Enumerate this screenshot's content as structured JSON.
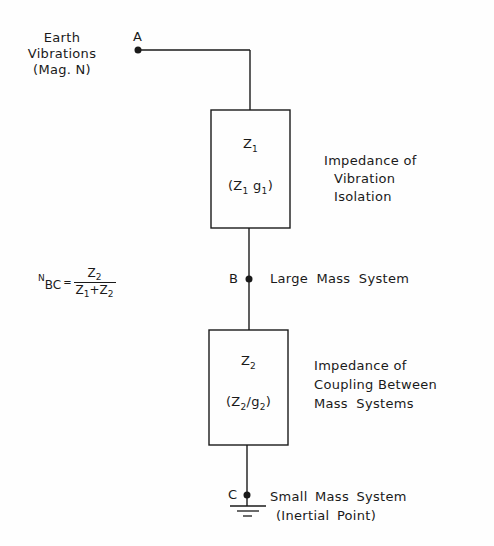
{
  "diagram": {
    "source": {
      "label_lines": [
        "Earth",
        "Vibrations",
        "(Mag. N)"
      ],
      "node": "A"
    },
    "box1": {
      "symbol": "Z",
      "symbol_sub": "1",
      "param_open": "(Z",
      "param_sub1": "1",
      "param_mid": " g",
      "param_sub2": "1",
      "param_close": ")",
      "description_lines": [
        "Impedance of",
        "Vibration",
        "Isolation"
      ]
    },
    "node_b": {
      "node": "B",
      "label": "Large Mass System"
    },
    "formula": {
      "lhs_sup": "N",
      "lhs_sub": "BC",
      "equals": "=",
      "numerator": "Z",
      "numerator_sub": "2",
      "denominator_a": "Z",
      "denominator_a_sub": "1",
      "plus": "+",
      "denominator_b": "Z",
      "denominator_b_sub": "2"
    },
    "box2": {
      "symbol": "Z",
      "symbol_sub": "2",
      "param_open": "(Z",
      "param_sub1": "2",
      "param_mid": "/g",
      "param_sub2": "2",
      "param_close": ")",
      "description_lines": [
        "Impedance of",
        "Coupling Between",
        "Mass Systems"
      ]
    },
    "node_c": {
      "node": "C",
      "label_lines": [
        "Small Mass System",
        "(Inertial Point)"
      ]
    },
    "colors": {
      "ink": "#1a1a1a",
      "paper": "#fefefe"
    }
  }
}
